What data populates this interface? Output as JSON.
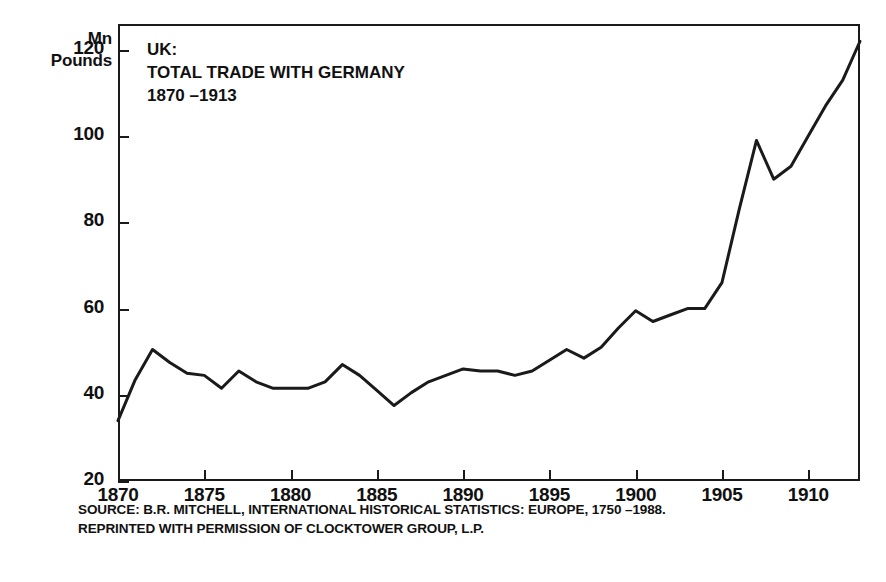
{
  "figure": {
    "unit_caption_line1": "Mn",
    "unit_caption_line2": "Pounds",
    "title_line1": "UK:",
    "title_line2": "TOTAL TRADE WITH GERMANY",
    "title_line3": "1870 –1913",
    "source_line1": "SOURCE: B.R. MITCHELL, INTERNATIONAL HISTORICAL STATISTICS: EUROPE, 1750 –1988.",
    "source_line2": "REPRINTED WITH PERMISSION OF CLOCKTOWER GROUP, L.P.",
    "line_color": "#1a1a1a",
    "frame_color": "#1a1a1a",
    "background_color": "#ffffff"
  },
  "chart_data": {
    "type": "line",
    "title": "UK: TOTAL TRADE WITH GERMANY 1870 –1913",
    "xlabel": "",
    "ylabel": "Mn Pounds",
    "xlim": [
      1870,
      1913
    ],
    "ylim": [
      20,
      126
    ],
    "grid": false,
    "legend": false,
    "xticks": [
      1870,
      1875,
      1880,
      1885,
      1890,
      1895,
      1900,
      1905,
      1910
    ],
    "xtick_labels": [
      "1870",
      "1875",
      "1880",
      "1885",
      "1890",
      "1895",
      "1900",
      "1905",
      "1910"
    ],
    "yticks": [
      20,
      40,
      60,
      80,
      100,
      120
    ],
    "ytick_labels": [
      "20",
      "40",
      "60",
      "80",
      "100",
      "120"
    ],
    "x": [
      1870,
      1871,
      1872,
      1873,
      1874,
      1875,
      1876,
      1877,
      1878,
      1879,
      1880,
      1881,
      1882,
      1883,
      1884,
      1885,
      1886,
      1887,
      1888,
      1889,
      1890,
      1891,
      1892,
      1893,
      1894,
      1895,
      1896,
      1897,
      1898,
      1899,
      1900,
      1901,
      1902,
      1903,
      1904,
      1905,
      1906,
      1907,
      1908,
      1909,
      1910,
      1911,
      1912,
      1913
    ],
    "values": [
      34.0,
      43.5,
      50.5,
      47.5,
      45.0,
      44.5,
      41.5,
      45.5,
      43.0,
      41.5,
      41.5,
      41.5,
      43.0,
      47.0,
      44.5,
      41.0,
      37.5,
      40.5,
      43.0,
      44.5,
      46.0,
      45.5,
      45.5,
      44.5,
      45.5,
      48.0,
      50.5,
      48.5,
      51.0,
      55.5,
      59.5,
      57.0,
      58.5,
      60.0,
      60.0,
      66.0,
      83.0,
      99.0,
      90.0,
      93.0,
      100.0,
      107.0,
      113.0,
      122.0
    ],
    "series": [
      {
        "name": "UK total trade with Germany",
        "values": [
          34.0,
          43.5,
          50.5,
          47.5,
          45.0,
          44.5,
          41.5,
          45.5,
          43.0,
          41.5,
          41.5,
          41.5,
          43.0,
          47.0,
          44.5,
          41.0,
          37.5,
          40.5,
          43.0,
          44.5,
          46.0,
          45.5,
          45.5,
          44.5,
          45.5,
          48.0,
          50.5,
          48.5,
          51.0,
          55.5,
          59.5,
          57.0,
          58.5,
          60.0,
          60.0,
          66.0,
          83.0,
          99.0,
          90.0,
          93.0,
          100.0,
          107.0,
          113.0,
          122.0
        ],
        "color": "#1a1a1a"
      }
    ]
  }
}
